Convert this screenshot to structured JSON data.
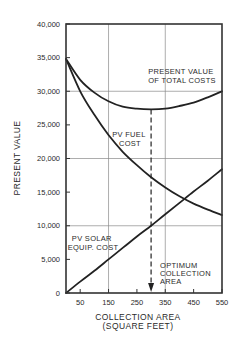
{
  "chart_data": {
    "type": "line",
    "title": "",
    "xlabel": "COLLECTION AREA",
    "xlabel_sub": "(SQUARE FEET)",
    "ylabel": "PRESENT VALUE",
    "xlim": [
      0,
      550
    ],
    "ylim": [
      0,
      40000
    ],
    "x_ticks": [
      50,
      150,
      250,
      350,
      450,
      550
    ],
    "x_tick_labels": [
      "50",
      "150",
      "250",
      "350",
      "450",
      "550"
    ],
    "y_ticks": [
      0,
      5000,
      10000,
      15000,
      20000,
      25000,
      30000,
      35000,
      40000
    ],
    "y_tick_labels": [
      "0",
      "5,000",
      "10,000",
      "15,000",
      "20,000",
      "25,000",
      "30,000",
      "35,000",
      "40,000"
    ],
    "grid": {
      "x": [
        150,
        350
      ],
      "y": [
        10000,
        20000,
        30000
      ]
    },
    "x": [
      0,
      50,
      100,
      150,
      200,
      250,
      300,
      350,
      400,
      450,
      500,
      550
    ],
    "series": [
      {
        "name": "PRESENT VALUE OF TOTAL COSTS",
        "values": [
          34800,
          31700,
          29800,
          28500,
          27700,
          27400,
          27300,
          27400,
          27800,
          28300,
          29100,
          30000
        ]
      },
      {
        "name": "PV FUEL COST",
        "values": [
          34800,
          30000,
          26500,
          23500,
          21000,
          19000,
          17200,
          15700,
          14400,
          13300,
          12400,
          11600
        ]
      },
      {
        "name": "PV SOLAR EQUIP. COST",
        "values": [
          0,
          1700,
          3300,
          5000,
          6700,
          8400,
          10000,
          11700,
          13400,
          15100,
          16700,
          18400
        ]
      }
    ],
    "annotations": [
      {
        "text_lines": [
          "PRESENT VALUE",
          "OF TOTAL COSTS"
        ],
        "target": "PRESENT VALUE OF TOTAL COSTS"
      },
      {
        "text_lines": [
          "PV FUEL",
          "COST"
        ],
        "target": "PV FUEL COST"
      },
      {
        "text_lines": [
          "PV SOLAR",
          "EQUIP. COST"
        ],
        "target": "PV SOLAR EQUIP. COST"
      },
      {
        "text_lines": [
          "OPTIMUM",
          "COLLECTION",
          "AREA"
        ],
        "x": 300,
        "style": "dashed vertical line with downward arrow"
      }
    ],
    "legend": "none (inline labels)"
  },
  "labels": {
    "ylabel": "PRESENT VALUE",
    "xlabel": "COLLECTION AREA",
    "xlabel_sub": "(SQUARE FEET)",
    "total": [
      "PRESENT VALUE",
      "OF TOTAL COSTS"
    ],
    "fuel": [
      "PV FUEL",
      "COST"
    ],
    "solar": [
      "PV SOLAR",
      "EQUIP. COST"
    ],
    "optimum": [
      "OPTIMUM",
      "COLLECTION",
      "AREA"
    ]
  },
  "colors": {
    "line": "#222222",
    "grid": "#8a8a8a",
    "frame": "#333333",
    "background": "#ffffff"
  }
}
